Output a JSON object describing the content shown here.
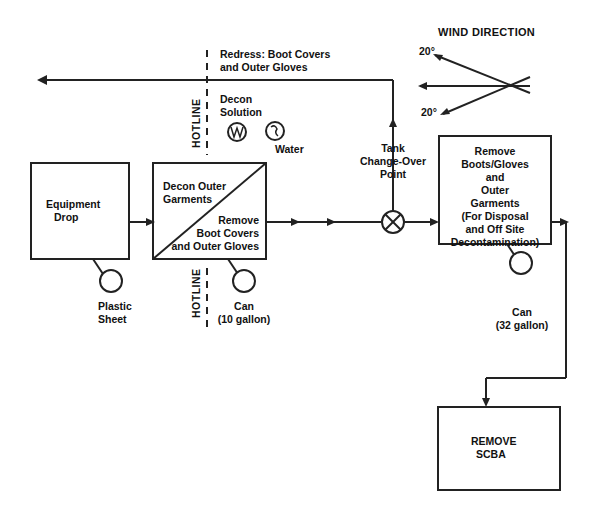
{
  "wind": {
    "title": "WIND DIRECTION",
    "angle_top": "20°",
    "angle_bottom": "20°"
  },
  "redress": {
    "line1": "Redress: Boot Covers",
    "line2": "and Outer Gloves"
  },
  "hotline": {
    "label_top": "HOTLINE",
    "label_bottom": "HOTLINE"
  },
  "decon_solution": {
    "line1": "Decon",
    "line2": "Solution",
    "icon": "decon-solution-tub-icon"
  },
  "water": {
    "label": "Water",
    "icon": "water-tub-icon"
  },
  "equipment_drop": {
    "line1": "Equipment",
    "line2": "Drop"
  },
  "plastic_sheet": {
    "line1": "Plastic",
    "line2": "Sheet"
  },
  "decon_station": {
    "upper_line1": "Decon Outer",
    "upper_line2": "Garments",
    "lower_line1": "Remove",
    "lower_line2": "Boot Covers",
    "lower_line3": "and Outer Gloves"
  },
  "can_10": {
    "line1": "Can",
    "line2": "(10 gallon)"
  },
  "tank_change": {
    "line1": "Tank",
    "line2": "Change-Over",
    "line3": "Point"
  },
  "remove_boots": {
    "lines": [
      "Remove",
      "Boots/Gloves",
      "and",
      "Outer",
      "Garments",
      "(For Disposal",
      "and Off Site",
      "Decontamination)"
    ]
  },
  "can_32": {
    "line1": "Can",
    "line2": "(32 gallon)"
  },
  "remove_scba": {
    "line1": "REMOVE",
    "line2": "SCBA"
  },
  "colors": {
    "line": "#222222",
    "background": "#ffffff"
  }
}
